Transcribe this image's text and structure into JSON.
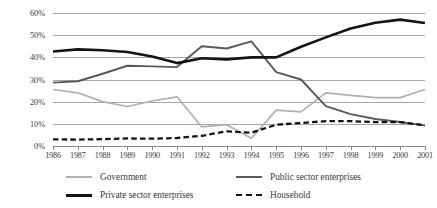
{
  "chart_data": {
    "type": "line",
    "title": "",
    "xlabel": "",
    "ylabel": "",
    "x": [
      1986,
      1987,
      1988,
      1989,
      1990,
      1991,
      1992,
      1993,
      1994,
      1995,
      1996,
      1997,
      1998,
      1999,
      2000,
      2001
    ],
    "categories": [
      "1986",
      "1987",
      "1988",
      "1989",
      "1990",
      "1991",
      "1992",
      "1993",
      "1994",
      "1995",
      "1996",
      "1997",
      "1998",
      "1999",
      "2000",
      "2001"
    ],
    "ylim": [
      0,
      60
    ],
    "yticks": [
      0,
      10,
      20,
      30,
      40,
      50,
      60
    ],
    "ytick_labels": [
      "0%",
      "10%",
      "20%",
      "30%",
      "40%",
      "50%",
      "60%"
    ],
    "grid": true,
    "legend_position": "bottom",
    "series": [
      {
        "name": "Government",
        "color": "#b0b0b0",
        "style": "solid",
        "width": 1.7,
        "values": [
          25.5,
          24.0,
          20.0,
          17.8,
          20.3,
          22.2,
          8.6,
          9.6,
          3.5,
          16.2,
          15.4,
          24.0,
          22.8,
          21.8,
          21.8,
          25.5
        ]
      },
      {
        "name": "Public sector enterprises",
        "color": "#5a5a5a",
        "style": "solid",
        "width": 1.9,
        "values": [
          28.6,
          29.2,
          32.6,
          36.2,
          35.9,
          35.6,
          45.0,
          44.0,
          47.2,
          33.3,
          30.0,
          18.0,
          14.4,
          12.2,
          10.8,
          9.2
        ]
      },
      {
        "name": "Private sector enterprises",
        "color": "#141414",
        "style": "solid",
        "width": 2.6,
        "values": [
          42.6,
          43.6,
          43.2,
          42.4,
          40.4,
          37.4,
          39.6,
          39.1,
          40.0,
          40.0,
          44.8,
          49.0,
          53.0,
          55.6,
          57.0,
          55.5
        ]
      },
      {
        "name": "Household",
        "color": "#141414",
        "style": "dashed",
        "width": 2.3,
        "values": [
          3.0,
          2.9,
          3.1,
          3.4,
          3.3,
          3.6,
          4.6,
          6.6,
          6.0,
          9.6,
          10.4,
          11.2,
          11.2,
          10.8,
          10.8,
          9.3
        ]
      }
    ],
    "legend": [
      {
        "label": "Government",
        "color": "#b0b0b0",
        "style": "solid",
        "width": 2.0
      },
      {
        "label": "Public sector enterprises",
        "color": "#5a5a5a",
        "style": "solid",
        "width": 2.4
      },
      {
        "label": "Private sector enterprises",
        "color": "#141414",
        "style": "solid",
        "width": 3.0
      },
      {
        "label": "Household",
        "color": "#141414",
        "style": "dashed",
        "width": 2.6
      }
    ]
  }
}
